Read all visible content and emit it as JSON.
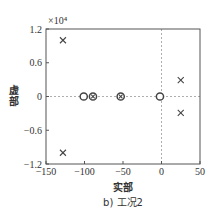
{
  "chart_data": {
    "type": "scatter",
    "title": "",
    "caption": "b) 工况2",
    "xlabel": "实部",
    "ylabel": "虚部",
    "y_exponent_label": "×10⁴",
    "xlim": [
      -150,
      50
    ],
    "ylim": [
      -1.2,
      1.2
    ],
    "xticks": [
      -150,
      -100,
      -50,
      0,
      50
    ],
    "xtick_labels": [
      "−150",
      "−100",
      "−50",
      "0",
      "50"
    ],
    "yticks": [
      1.2,
      0.6,
      0,
      -0.6,
      -1.2
    ],
    "ytick_labels": [
      "1.2",
      "0.6",
      "0",
      "−0.6",
      "−1.2"
    ],
    "grid": false,
    "reference_lines": [
      {
        "orientation": "horizontal",
        "value": 0,
        "style": "dashed"
      },
      {
        "orientation": "vertical",
        "value": 0,
        "style": "dashed"
      }
    ],
    "series": [
      {
        "name": "poles",
        "marker": "x",
        "points": [
          {
            "x": -128,
            "y": 1.0
          },
          {
            "x": -128,
            "y": -1.0
          },
          {
            "x": 25,
            "y": 0.29
          },
          {
            "x": 25,
            "y": -0.29
          }
        ]
      },
      {
        "name": "zeros",
        "marker": "o",
        "points": [
          {
            "x": -101,
            "y": 0
          },
          {
            "x": -2,
            "y": 0
          }
        ]
      },
      {
        "name": "pole-zero overlap",
        "marker": "o-x",
        "points": [
          {
            "x": -89,
            "y": 0
          },
          {
            "x": -53,
            "y": 0
          }
        ]
      }
    ],
    "colors": {
      "axis": "#555555",
      "marker": "#444444",
      "reference_line": "#999999"
    }
  }
}
